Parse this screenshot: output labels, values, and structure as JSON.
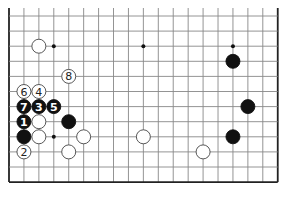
{
  "board": {
    "columns": 19,
    "rows_visible": 12,
    "origin_x": 9,
    "origin_y": 16,
    "spacing_x": 14.93,
    "spacing_y": 15.1,
    "top_crop_y": 8,
    "line_color": "#888888",
    "edge_color": "#222222",
    "star_points": [
      [
        3,
        2
      ],
      [
        9,
        2
      ],
      [
        15,
        2
      ],
      [
        3,
        8
      ]
    ]
  },
  "stones": [
    {
      "color": "white",
      "col": 2,
      "row": 2,
      "label": ""
    },
    {
      "color": "black",
      "col": 15,
      "row": 3,
      "label": ""
    },
    {
      "color": "white",
      "col": 4,
      "row": 4,
      "label": "8"
    },
    {
      "color": "white",
      "col": 1,
      "row": 5,
      "label": "6"
    },
    {
      "color": "white",
      "col": 2,
      "row": 5,
      "label": "4"
    },
    {
      "color": "black",
      "col": 1,
      "row": 6,
      "label": "7"
    },
    {
      "color": "black",
      "col": 2,
      "row": 6,
      "label": "3"
    },
    {
      "color": "black",
      "col": 3,
      "row": 6,
      "label": "5"
    },
    {
      "color": "black",
      "col": 16,
      "row": 6,
      "label": ""
    },
    {
      "color": "black",
      "col": 1,
      "row": 7,
      "label": "1"
    },
    {
      "color": "white",
      "col": 2,
      "row": 7,
      "label": ""
    },
    {
      "color": "black",
      "col": 4,
      "row": 7,
      "label": ""
    },
    {
      "color": "black",
      "col": 1,
      "row": 8,
      "label": ""
    },
    {
      "color": "white",
      "col": 2,
      "row": 8,
      "label": ""
    },
    {
      "color": "white",
      "col": 5,
      "row": 8,
      "label": ""
    },
    {
      "color": "white",
      "col": 9,
      "row": 8,
      "label": ""
    },
    {
      "color": "black",
      "col": 15,
      "row": 8,
      "label": ""
    },
    {
      "color": "white",
      "col": 1,
      "row": 9,
      "label": "2"
    },
    {
      "color": "white",
      "col": 4,
      "row": 9,
      "label": ""
    },
    {
      "color": "white",
      "col": 13,
      "row": 9,
      "label": ""
    }
  ]
}
